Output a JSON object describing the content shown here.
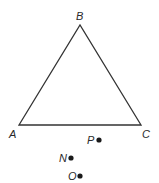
{
  "diagram": {
    "type": "geometry",
    "stroke_color": "#333333",
    "triangle": {
      "vertices": [
        {
          "name": "A",
          "label": "A",
          "x": 19,
          "y": 125,
          "label_x": 9,
          "label_y": 138
        },
        {
          "name": "B",
          "label": "B",
          "x": 80,
          "y": 25,
          "label_x": 76,
          "label_y": 20
        },
        {
          "name": "C",
          "label": "C",
          "x": 141,
          "y": 125,
          "label_x": 142,
          "label_y": 138
        }
      ]
    },
    "points": [
      {
        "name": "P",
        "label": "P",
        "x": 99,
        "y": 140,
        "label_x": 87,
        "label_y": 144
      },
      {
        "name": "N",
        "label": "N",
        "x": 71,
        "y": 158,
        "label_x": 59,
        "label_y": 162
      },
      {
        "name": "O",
        "label": "O",
        "x": 80,
        "y": 176,
        "label_x": 68,
        "label_y": 180
      }
    ]
  }
}
